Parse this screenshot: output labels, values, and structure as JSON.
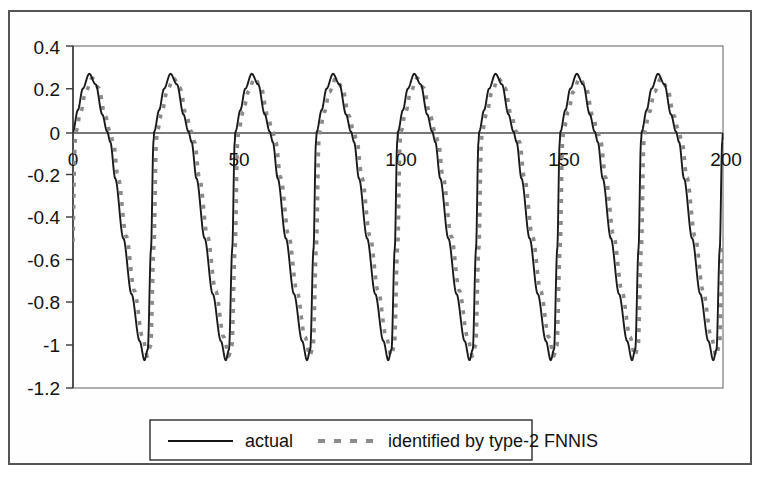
{
  "chart_data": {
    "type": "line",
    "title": "",
    "subtitle": "",
    "xlabel": "",
    "ylabel": "",
    "xlim": [
      0,
      200
    ],
    "ylim": [
      -1.2,
      0.4
    ],
    "grid": false,
    "legend_position": "bottom",
    "x_ticks": [
      "0",
      "50",
      "100",
      "150",
      "200"
    ],
    "x_tick_values": [
      0,
      50,
      100,
      150,
      200
    ],
    "y_ticks": [
      "0.4",
      "0.2",
      "0",
      "-0.2",
      "-0.4",
      "-0.6",
      "-0.8",
      "-1",
      "-1.2"
    ],
    "y_tick_values": [
      0.4,
      0.2,
      0,
      -0.2,
      -0.4,
      -0.6,
      -0.8,
      -1,
      -1.2
    ],
    "waveform": {
      "period": 25,
      "peak_value": 0.27,
      "trough_value": -1.07,
      "baseline_value": 0.0,
      "cycles": 8,
      "shape": "asymmetric-pulse"
    },
    "series": [
      {
        "name": "actual",
        "style": "solid",
        "color": "#1a1a1a",
        "lag": 0.0,
        "amplitude_peak": 0.27,
        "amplitude_trough": -1.07
      },
      {
        "name": "identified by type-2 FNNIS",
        "style": "dashed",
        "color": "#8a8a8a",
        "lag": 0.9,
        "amplitude_peak": 0.25,
        "amplitude_trough": -1.05
      }
    ],
    "keypoints_per_cycle": [
      {
        "t": 0.0,
        "y": 0.0
      },
      {
        "t": 0.06,
        "y": 0.1
      },
      {
        "t": 0.12,
        "y": 0.2
      },
      {
        "t": 0.2,
        "y": 0.27
      },
      {
        "t": 0.28,
        "y": 0.22
      },
      {
        "t": 0.36,
        "y": 0.08
      },
      {
        "t": 0.42,
        "y": 0.0
      },
      {
        "t": 0.46,
        "y": -0.05
      },
      {
        "t": 0.52,
        "y": -0.22
      },
      {
        "t": 0.62,
        "y": -0.5
      },
      {
        "t": 0.72,
        "y": -0.76
      },
      {
        "t": 0.82,
        "y": -0.98
      },
      {
        "t": 0.88,
        "y": -1.07
      },
      {
        "t": 0.92,
        "y": -1.02
      },
      {
        "t": 0.96,
        "y": -0.55
      },
      {
        "t": 0.99,
        "y": -0.05
      },
      {
        "t": 1.0,
        "y": 0.0
      }
    ]
  },
  "legend": {
    "actual_label": "actual",
    "identified_label": "identified by type-2 FNNIS"
  }
}
